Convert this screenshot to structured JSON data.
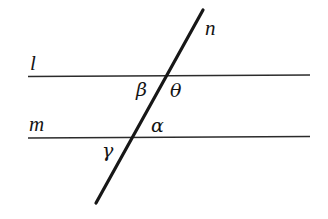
{
  "figure": {
    "background_color": "#ffffff",
    "stroke_color": "#141414",
    "width": 328,
    "height": 219
  },
  "lines": [
    {
      "name": "l",
      "label": "l",
      "kind": "horizontal",
      "x1": 28,
      "y1": 76,
      "x2": 310,
      "y2": 75,
      "stroke_width": 1.6
    },
    {
      "name": "m",
      "label": "m",
      "kind": "horizontal",
      "x1": 28,
      "y1": 138,
      "x2": 310,
      "y2": 136,
      "stroke_width": 1.6
    },
    {
      "name": "n",
      "label": "n",
      "kind": "transversal",
      "x1": 96,
      "y1": 203,
      "x2": 203,
      "y2": 10,
      "stroke_width": 3.1
    }
  ],
  "angles": [
    {
      "name": "beta",
      "label": "β",
      "position": "below line l, left of n"
    },
    {
      "name": "theta",
      "label": "θ",
      "position": "below line l, right of n"
    },
    {
      "name": "alpha",
      "label": "α",
      "position": "above line m, right of n"
    },
    {
      "name": "gamma",
      "label": "γ",
      "position": "below line m, left of n"
    }
  ],
  "intersections": [
    {
      "lines": "l and n",
      "x": 167,
      "y": 76
    },
    {
      "lines": "m and n",
      "x": 133,
      "y": 137
    }
  ]
}
